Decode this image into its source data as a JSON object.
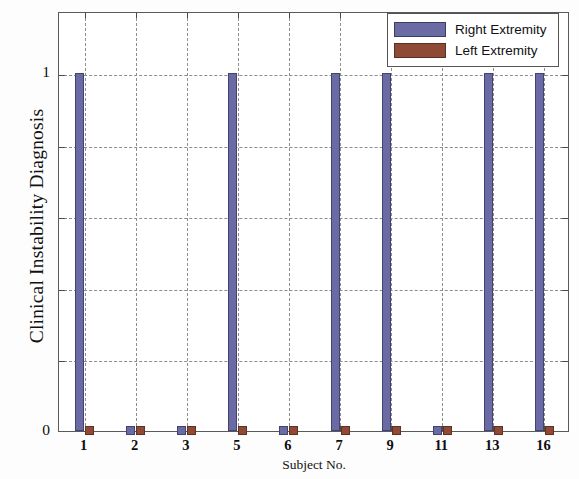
{
  "chart_data": {
    "type": "bar",
    "title": "",
    "xlabel": "Subject No.",
    "ylabel": "Clinical Instability Diagnosis",
    "categories": [
      "1",
      "2",
      "3",
      "5",
      "6",
      "7",
      "9",
      "11",
      "13",
      "16"
    ],
    "series": [
      {
        "name": "Right Extremity",
        "color": "#6a6aa4",
        "values": [
          1,
          0,
          0,
          1,
          0,
          1,
          1,
          0,
          1,
          1
        ]
      },
      {
        "name": "Left Extremity",
        "color": "#8e4a37",
        "values": [
          0,
          0,
          0,
          0,
          0,
          0,
          0,
          0,
          0,
          0
        ]
      }
    ],
    "ylim": [
      0,
      1
    ],
    "ytick_labels": [
      "0",
      "1"
    ],
    "ytick_values": [
      0,
      1
    ],
    "gridlines_y": [
      0.2,
      0.4,
      0.6,
      0.8,
      1.0
    ],
    "grid": true,
    "legend_position": "top-right"
  },
  "axes": {
    "y_title": "Clinical Instability Diagnosis",
    "x_title": "Subject No.",
    "y_labels": [
      "1",
      "0"
    ]
  },
  "legend": {
    "entries": [
      {
        "label": "Right Extremity",
        "swatch": "right"
      },
      {
        "label": "Left Extremity",
        "swatch": "left"
      }
    ]
  },
  "colors": {
    "right_extremity": "#6a6aa4",
    "left_extremity": "#8e4a37",
    "grid": "#8d8d8d",
    "axis": "#5a5a5a",
    "background": "#ffffff"
  }
}
